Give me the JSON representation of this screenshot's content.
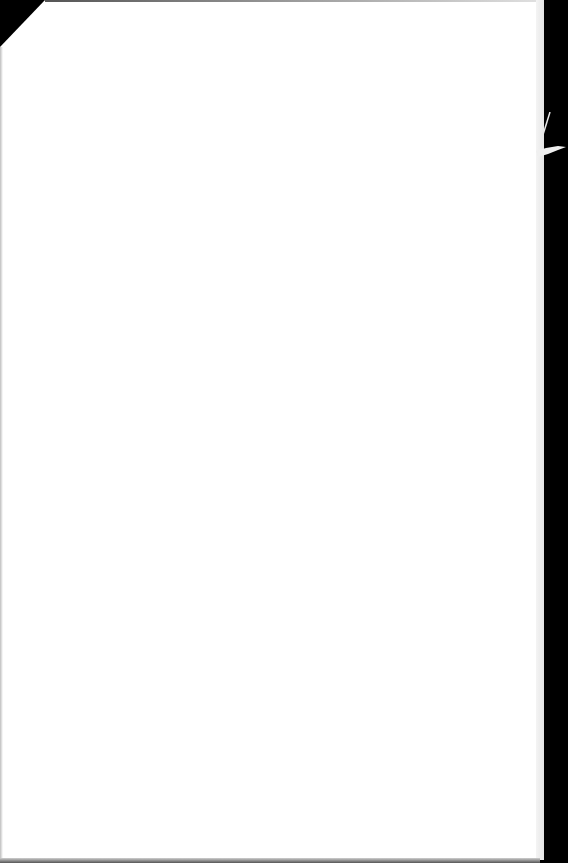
{
  "document": {
    "type": "scanned-page",
    "content": "",
    "background_color": "#000000",
    "paper_color": "#ffffff"
  }
}
